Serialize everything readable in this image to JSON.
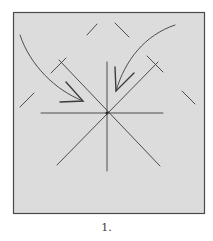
{
  "figure": {
    "caption": "1.",
    "paper_color": "#dcdcdc",
    "line_color": "#3c3c3c",
    "border_color": "#4a4a4a"
  }
}
